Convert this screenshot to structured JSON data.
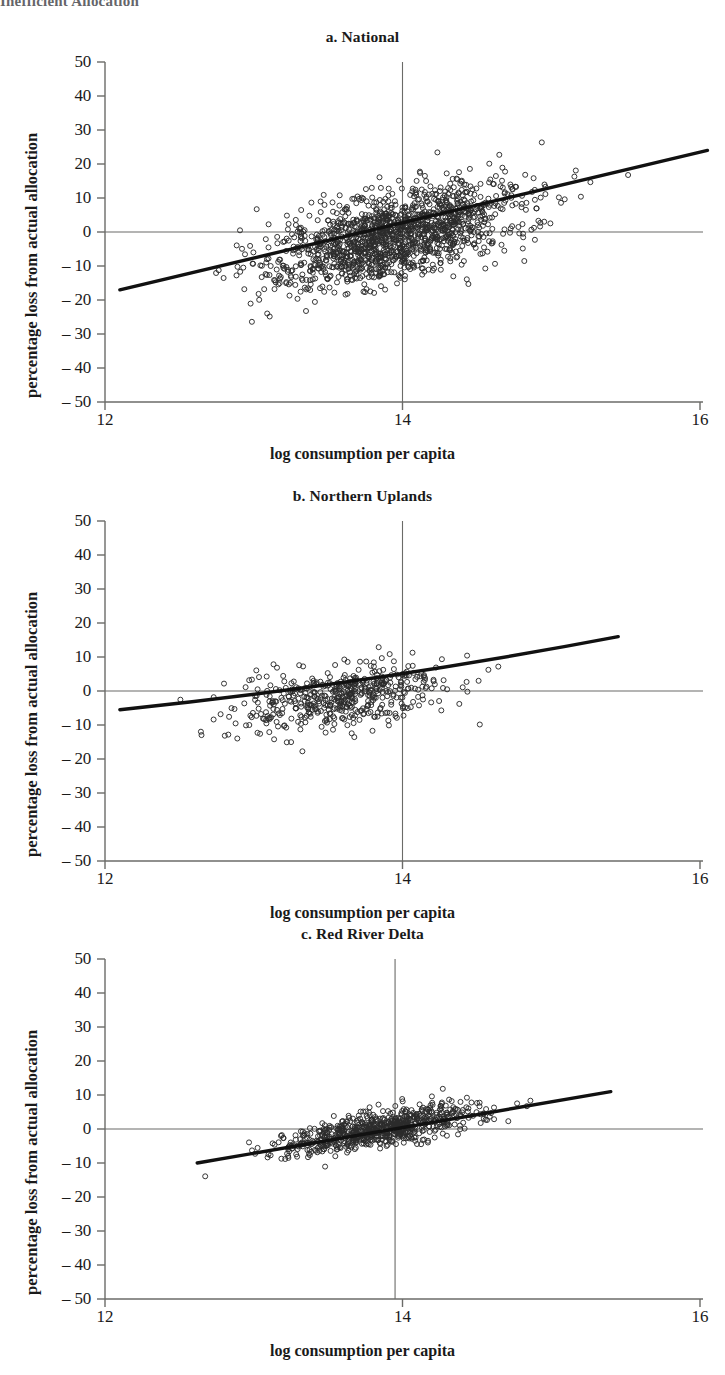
{
  "page": {
    "clipped_header": "Inefficient Allocation"
  },
  "axis": {
    "xlabel": "log consumption per capita",
    "ylabel": "percentage loss from actual allocation",
    "yticks": [
      "50",
      "40",
      "30",
      "20",
      "10",
      "0",
      "– 10",
      "– 20",
      "– 30",
      "– 40",
      "– 50"
    ],
    "ytick_values": [
      50,
      40,
      30,
      20,
      10,
      0,
      -10,
      -20,
      -30,
      -40,
      -50
    ],
    "xticks": [
      "12",
      "14",
      "16"
    ],
    "xtick_values": [
      12,
      14,
      16
    ]
  },
  "colors": {
    "ink": "#1a1a1a",
    "axis": "#6b6b68",
    "marker": "#2b2b2b",
    "fit_line": "#111111"
  },
  "chart_data": [
    {
      "type": "scatter",
      "id": "national",
      "title": "a. National",
      "xlabel": "log consumption per capita",
      "ylabel": "percentage loss from actual allocation",
      "xlim": [
        12,
        16
      ],
      "ylim": [
        -50,
        50
      ],
      "grid": false,
      "legend": "none",
      "reference_lines": [
        {
          "orientation": "horizontal",
          "value": 0
        },
        {
          "orientation": "vertical",
          "value": 14
        }
      ],
      "fit_line": {
        "x": [
          12.1,
          16.05
        ],
        "y": [
          -17.0,
          24.0
        ],
        "style": "solid-thick"
      },
      "n_points": 1500,
      "cluster": {
        "x_center": 13.95,
        "x_sd": 0.42,
        "y_center": -1.0,
        "y_sd": 7.5,
        "correlation": 0.52,
        "y_slope_per_x": 10.4
      },
      "description": "Dense cloud of open circles spanning log consumption 12.2 to 16.1 and percentage loss -40 to 45, rising with consumption."
    },
    {
      "type": "scatter",
      "id": "northern-uplands",
      "title": "b. Northern Uplands",
      "xlabel": "log consumption per capita",
      "ylabel": "percentage loss from actual allocation",
      "xlim": [
        12,
        16
      ],
      "ylim": [
        -50,
        50
      ],
      "grid": false,
      "legend": "none",
      "reference_lines": [
        {
          "orientation": "horizontal",
          "value": 0
        },
        {
          "orientation": "vertical",
          "value": 14
        }
      ],
      "fit_line": {
        "x": [
          12.1,
          15.45
        ],
        "y": [
          -5.5,
          16.0
        ],
        "style": "solid-thick-curved"
      },
      "n_points": 520,
      "cluster": {
        "x_center": 13.6,
        "x_sd": 0.36,
        "y_center": -1.5,
        "y_sd": 5.2,
        "correlation": 0.45,
        "y_slope_per_x": 6.4
      },
      "description": "Moderately dense open-circle cloud from 12.1 to 15.5, percentage loss mostly between -20 and 20."
    },
    {
      "type": "scatter",
      "id": "red-river-delta",
      "title": "c. Red River Delta",
      "xlabel": "log consumption per capita",
      "ylabel": "percentage loss from actual allocation",
      "xlim": [
        12,
        16
      ],
      "ylim": [
        -50,
        50
      ],
      "grid": false,
      "legend": "none",
      "reference_lines": [
        {
          "orientation": "horizontal",
          "value": 0
        },
        {
          "orientation": "vertical",
          "value": 13.95
        }
      ],
      "fit_line": {
        "x": [
          12.62,
          15.4
        ],
        "y": [
          -10.0,
          11.0
        ],
        "style": "solid-thick"
      },
      "n_points": 760,
      "cluster": {
        "x_center": 13.85,
        "x_sd": 0.33,
        "y_center": 0.0,
        "y_sd": 3.6,
        "correlation": 0.72,
        "y_slope_per_x": 7.6
      },
      "description": "Tight elongated band of open circles from 12.6 to 15.4 rising from -10 to about 20 percent."
    }
  ],
  "panel_layout": [
    {
      "id": "national",
      "title_top": 28,
      "plot_top": 62,
      "plot_height": 340
    },
    {
      "id": "northern-uplands",
      "title_top": 487,
      "plot_top": 521,
      "plot_height": 340
    },
    {
      "id": "red-river-delta",
      "title_top": 925,
      "plot_top": 959,
      "plot_height": 340
    }
  ]
}
